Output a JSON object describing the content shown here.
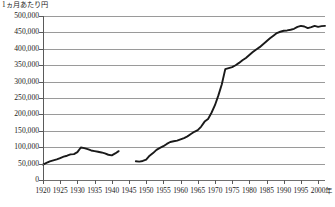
{
  "chart_data": {
    "type": "line",
    "title": "",
    "subtitle": "",
    "ylabel": "1ヵ月あたり円",
    "xlabel": "年",
    "ylim": [
      0,
      500000
    ],
    "xlim": [
      1920,
      2002
    ],
    "grid": true,
    "legend": null,
    "y_ticks": [
      {
        "value": 500000,
        "label": "500,000"
      },
      {
        "value": 450000,
        "label": "450,000"
      },
      {
        "value": 400000,
        "label": "400,000"
      },
      {
        "value": 350000,
        "label": "350,000"
      },
      {
        "value": 300000,
        "label": "300,000"
      },
      {
        "value": 250000,
        "label": "250,000"
      },
      {
        "value": 200000,
        "label": "200,000"
      },
      {
        "value": 150000,
        "label": "150,000"
      },
      {
        "value": 100000,
        "label": "100,000"
      },
      {
        "value": 50000,
        "label": "50,000"
      },
      {
        "value": 0,
        "label": "0"
      }
    ],
    "x_ticks": [
      {
        "value": 1920,
        "label": "1920"
      },
      {
        "value": 1925,
        "label": "1925"
      },
      {
        "value": 1930,
        "label": "1930"
      },
      {
        "value": 1935,
        "label": "1935"
      },
      {
        "value": 1940,
        "label": "1940"
      },
      {
        "value": 1945,
        "label": "1945"
      },
      {
        "value": 1950,
        "label": "1950"
      },
      {
        "value": 1955,
        "label": "1955"
      },
      {
        "value": 1960,
        "label": "1960"
      },
      {
        "value": 1965,
        "label": "1965"
      },
      {
        "value": 1970,
        "label": "1970"
      },
      {
        "value": 1975,
        "label": "1975"
      },
      {
        "value": 1980,
        "label": "1980"
      },
      {
        "value": 1985,
        "label": "1985"
      },
      {
        "value": 1990,
        "label": "1990"
      },
      {
        "value": 1995,
        "label": "1995"
      },
      {
        "value": 2000,
        "label": "2000"
      }
    ],
    "line_color": "#1a1a1a",
    "line_width": 1.9,
    "series": [
      {
        "name": "",
        "segments": [
          {
            "x": [
              1920,
              1921,
              1922,
              1923,
              1924,
              1925,
              1926,
              1927,
              1928,
              1929,
              1930,
              1931,
              1932,
              1933,
              1934,
              1935,
              1936,
              1937,
              1938,
              1939,
              1940,
              1941,
              1942
            ],
            "y": [
              47000,
              52000,
              57000,
              60000,
              63000,
              67000,
              71000,
              74000,
              78000,
              79000,
              85000,
              99000,
              97000,
              94000,
              90000,
              88000,
              86000,
              84000,
              81000,
              77000,
              75000,
              81000,
              88000
            ]
          },
          {
            "x": [
              1947,
              1948,
              1949,
              1950,
              1951,
              1952,
              1953,
              1954,
              1955,
              1956,
              1957,
              1958,
              1959,
              1960,
              1961,
              1962,
              1963,
              1964,
              1965,
              1966,
              1967,
              1968,
              1969,
              1970,
              1971,
              1972,
              1973,
              1974,
              1975,
              1976,
              1977,
              1978,
              1979,
              1980,
              1981,
              1982,
              1983,
              1984,
              1985,
              1986,
              1987,
              1988,
              1989,
              1990,
              1991,
              1992,
              1993,
              1994,
              1995,
              1996,
              1997,
              1998,
              1999,
              2000,
              2001,
              2002
            ],
            "y": [
              57000,
              56000,
              58000,
              62000,
              74000,
              82000,
              92000,
              98000,
              103000,
              110000,
              116000,
              118000,
              120000,
              124000,
              128000,
              133000,
              140000,
              147000,
              152000,
              163000,
              178000,
              186000,
              205000,
              228000,
              258000,
              292000,
              338000,
              341000,
              344000,
              350000,
              357000,
              365000,
              372000,
              381000,
              390000,
              398000,
              405000,
              414000,
              423000,
              432000,
              440000,
              448000,
              452000,
              455000,
              456000,
              458000,
              461000,
              467000,
              470000,
              468000,
              463000,
              466000,
              470000,
              467000,
              469000,
              470000
            ]
          }
        ]
      }
    ]
  }
}
